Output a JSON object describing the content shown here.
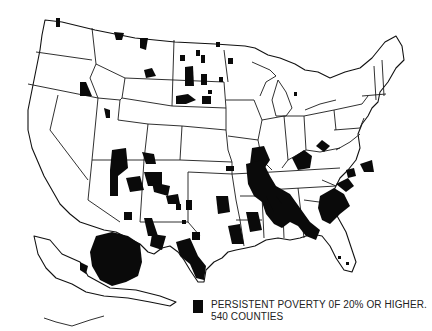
{
  "figure": {
    "type": "choropleth-map",
    "region": "United States (counties)",
    "legend": {
      "swatch_color": "#0a0a0a",
      "label_line1": "PERSISTENT POVERTY 0F 20% OR HIGHER.",
      "label_line2": "540 COUNTIES",
      "count": 540,
      "threshold_percent": 20
    },
    "colors": {
      "background": "#ffffff",
      "highlight": "#0a0a0a",
      "border": "#1a1a1a"
    },
    "highlighted_regions": [
      "Texas-Mexico border (Rio Grande)",
      "New Mexico / Arizona (Navajo, Four Corners)",
      "South Dakota reservations",
      "Montana / North Dakota reservations",
      "Mississippi Delta",
      "Alabama / Georgia Black Belt",
      "South Carolina",
      "Appalachian Kentucky / West Virginia",
      "Alaska (interior and western)"
    ]
  }
}
